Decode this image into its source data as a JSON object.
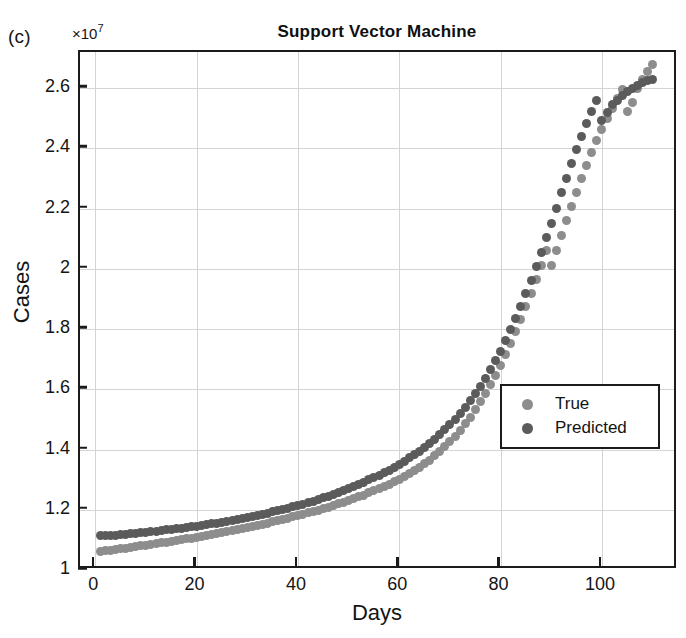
{
  "panel": {
    "label": "(c)"
  },
  "axis": {
    "y_multiplier_prefix": "×10",
    "y_multiplier_exponent": "7",
    "ylabel": "Cases",
    "xlabel": "Days"
  },
  "legend": {
    "entries": [
      {
        "label": "True",
        "color": "#8d8d8d",
        "marker": "circle"
      },
      {
        "label": "Predicted",
        "color": "#5b5b5b",
        "marker": "circle"
      }
    ]
  },
  "chart_data": {
    "type": "scatter",
    "title": "Support Vector Machine",
    "xlabel": "Days",
    "ylabel": "Cases",
    "y_multiplier": 10000000.0,
    "y_multiplier_text": "×10^7",
    "xlim": [
      -3,
      115
    ],
    "ylim": [
      1.0,
      2.72
    ],
    "xticks": [
      0,
      20,
      40,
      60,
      80,
      100
    ],
    "yticks": [
      1,
      1.2,
      1.4,
      1.6,
      1.8,
      2,
      2.2,
      2.4,
      2.6
    ],
    "xtick_labels": [
      "0",
      "20",
      "40",
      "60",
      "80",
      "100"
    ],
    "ytick_labels": [
      "1",
      "1.2",
      "1.4",
      "1.6",
      "1.8",
      "2",
      "2.2",
      "2.4",
      "2.6"
    ],
    "grid": true,
    "legend_position": "right-center",
    "x": [
      1,
      2,
      3,
      4,
      5,
      6,
      7,
      8,
      9,
      10,
      11,
      12,
      13,
      14,
      15,
      16,
      17,
      18,
      19,
      20,
      21,
      22,
      23,
      24,
      25,
      26,
      27,
      28,
      29,
      30,
      31,
      32,
      33,
      34,
      35,
      36,
      37,
      38,
      39,
      40,
      41,
      42,
      43,
      44,
      45,
      46,
      47,
      48,
      49,
      50,
      51,
      52,
      53,
      54,
      55,
      56,
      57,
      58,
      59,
      60,
      61,
      62,
      63,
      64,
      65,
      66,
      67,
      68,
      69,
      70,
      71,
      72,
      73,
      74,
      75,
      76,
      77,
      78,
      79,
      80,
      81,
      82,
      83,
      84,
      85,
      86,
      87,
      88,
      89,
      90,
      91,
      92,
      93,
      94,
      95,
      96,
      97,
      98,
      99,
      100,
      101,
      102,
      103,
      104,
      105,
      106,
      107,
      108,
      109,
      110
    ],
    "series": [
      {
        "name": "True",
        "color": "#8d8d8d",
        "values": [
          1.062,
          1.064,
          1.066,
          1.068,
          1.07,
          1.073,
          1.075,
          1.077,
          1.08,
          1.082,
          1.085,
          1.087,
          1.09,
          1.092,
          1.095,
          1.098,
          1.1,
          1.103,
          1.106,
          1.109,
          1.112,
          1.115,
          1.118,
          1.121,
          1.124,
          1.128,
          1.131,
          1.134,
          1.138,
          1.141,
          1.145,
          1.148,
          1.152,
          1.156,
          1.16,
          1.164,
          1.168,
          1.172,
          1.176,
          1.181,
          1.185,
          1.19,
          1.194,
          1.199,
          1.204,
          1.209,
          1.214,
          1.22,
          1.225,
          1.231,
          1.237,
          1.243,
          1.249,
          1.256,
          1.263,
          1.27,
          1.277,
          1.285,
          1.293,
          1.301,
          1.31,
          1.32,
          1.33,
          1.341,
          1.353,
          1.365,
          1.379,
          1.393,
          1.409,
          1.426,
          1.444,
          1.464,
          1.485,
          1.508,
          1.532,
          1.558,
          1.586,
          1.615,
          1.647,
          1.68,
          1.715,
          1.752,
          1.791,
          1.832,
          1.875,
          1.919,
          1.965,
          2.012,
          2.06,
          2.01,
          2.06,
          2.11,
          2.16,
          2.208,
          2.255,
          2.3,
          2.344,
          2.386,
          2.426,
          2.464,
          2.5,
          2.534,
          2.566,
          2.596,
          2.523,
          2.551,
          2.598,
          2.628,
          2.655,
          2.68
        ]
      },
      {
        "name": "Predicted",
        "color": "#5b5b5b",
        "values": [
          1.113,
          1.114,
          1.115,
          1.116,
          1.118,
          1.119,
          1.121,
          1.122,
          1.124,
          1.126,
          1.127,
          1.129,
          1.131,
          1.133,
          1.135,
          1.137,
          1.139,
          1.141,
          1.143,
          1.146,
          1.148,
          1.151,
          1.153,
          1.156,
          1.159,
          1.162,
          1.165,
          1.168,
          1.171,
          1.174,
          1.178,
          1.181,
          1.185,
          1.189,
          1.193,
          1.197,
          1.201,
          1.205,
          1.21,
          1.214,
          1.219,
          1.224,
          1.229,
          1.234,
          1.24,
          1.245,
          1.251,
          1.257,
          1.264,
          1.27,
          1.277,
          1.284,
          1.291,
          1.299,
          1.307,
          1.315,
          1.323,
          1.332,
          1.341,
          1.351,
          1.361,
          1.372,
          1.383,
          1.395,
          1.407,
          1.42,
          1.434,
          1.449,
          1.465,
          1.482,
          1.5,
          1.519,
          1.54,
          1.562,
          1.585,
          1.61,
          1.637,
          1.665,
          1.695,
          1.727,
          1.761,
          1.797,
          1.835,
          1.875,
          1.917,
          1.961,
          2.007,
          2.054,
          2.103,
          2.152,
          2.202,
          2.252,
          2.301,
          2.349,
          2.396,
          2.441,
          2.484,
          2.524,
          2.56,
          2.493,
          2.52,
          2.545,
          2.56,
          2.575,
          2.588,
          2.6,
          2.61,
          2.618,
          2.624,
          2.63
        ]
      }
    ]
  }
}
